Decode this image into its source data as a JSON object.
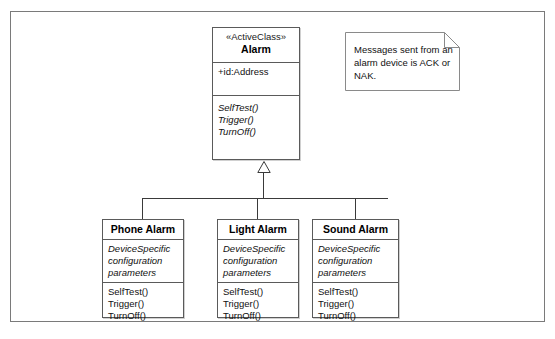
{
  "diagram": {
    "type": "uml-class-diagram",
    "superclass": {
      "stereotype": "«ActiveClass»",
      "name": "Alarm",
      "attributes": [
        "+id:Address"
      ],
      "operations": [
        "SelfTest()",
        "Trigger()",
        "TurnOff()"
      ]
    },
    "subclasses": [
      {
        "name": "Phone Alarm",
        "attributes": [
          "DeviceSpecific",
          "configuration",
          "parameters"
        ],
        "operations": [
          "SelfTest()",
          "Trigger()",
          "TurnOff()"
        ]
      },
      {
        "name": "Light Alarm",
        "attributes": [
          "DeviceSpecific",
          "configuration",
          "parameters"
        ],
        "operations": [
          "SelfTest()",
          "Trigger()",
          "TurnOff()"
        ]
      },
      {
        "name": "Sound Alarm",
        "attributes": [
          "DeviceSpecific",
          "configuration",
          "parameters"
        ],
        "operations": [
          "SelfTest()",
          "Trigger()",
          "TurnOff()"
        ]
      }
    ],
    "note": {
      "text": "Messages sent from an alarm device is ACK or NAK."
    },
    "relationship": "generalization",
    "colors": {
      "line": "#5a5a5a",
      "frame": "#7a7a7a",
      "text": "#111111",
      "background": "#ffffff"
    }
  }
}
